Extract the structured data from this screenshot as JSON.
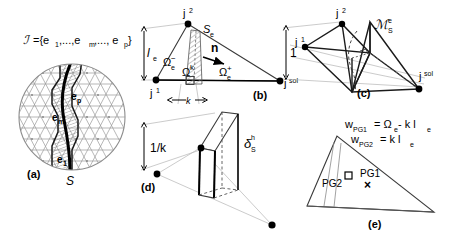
{
  "figure": {
    "caption_type": "multi-panel-scientific-diagram",
    "panels": [
      {
        "id": "a",
        "tag": "(a)",
        "title_formula": "ℐ ={e₁,...,eₘ,..., eₚ}",
        "labels": {
          "set_symbol": "ℐ",
          "set_body": "={e",
          "e_first_sub": "1",
          "mid": ",...,e",
          "e_mid_sub": "m",
          "tail": ",..., e",
          "e_last_sub": "p",
          "close": "}",
          "edge_p": "e",
          "edge_p_sub": "p",
          "edge_m": "e",
          "edge_m_sub": "m",
          "edge_1": "e",
          "edge_1_sub": "1",
          "surface": "S"
        }
      },
      {
        "id": "b",
        "tag": "(b)",
        "labels": {
          "node_j2": "j",
          "node_j2_sup": "2",
          "node_j1": "j",
          "node_j1_sup": "1",
          "node_jsol": "j",
          "node_jsol_sup": "sol",
          "surface_elem": "S",
          "surface_elem_sub": "e",
          "omega_minus": "Ω",
          "omega_minus_sub": "e",
          "omega_minus_sup": "−",
          "omega_plus": "Ω",
          "omega_plus_sub": "e",
          "omega_plus_sup": "+",
          "omega_k": "Ω",
          "omega_k_sup": "k",
          "normal": "n",
          "length_l": "l",
          "length_l_sub": "e",
          "thickness_k": "k"
        }
      },
      {
        "id": "c",
        "tag": "(c)",
        "labels": {
          "node_j2": "j",
          "node_j2_sup": "2",
          "node_j1": "j",
          "node_j1_sup": "1",
          "node_jsol": "j",
          "node_jsol_sup": "sol",
          "manifold": "ℳ",
          "manifold_sub": "S",
          "manifold_sup": "e",
          "height_one": "1"
        }
      },
      {
        "id": "d",
        "tag": "(d)",
        "labels": {
          "height": "1/k",
          "delta": "δ",
          "delta_sub": "S",
          "delta_sup": "h"
        }
      },
      {
        "id": "e",
        "tag": "(e)",
        "labels": {
          "eq1_w": "w",
          "eq1_w_sub": "PG1",
          "eq1_rhs_eq": "= Ω",
          "eq1_rhs_sub": "e",
          "eq1_rhs_tail": "- k l",
          "eq1_rhs_tail_sub": "e",
          "eq2_w": "w",
          "eq2_w_sub": "PG2",
          "eq2_rhs_eq": "=  k l",
          "eq2_rhs_sub": "e",
          "pg1": "PG1",
          "pg2": "PG2",
          "pg1_marker": "×",
          "pg2_marker": "□"
        }
      }
    ],
    "colors": {
      "ink": "#000000",
      "mesh_gray": "#9a9a9a",
      "light_gray": "#b4b4b4",
      "hatch_gray": "#8f8f8f",
      "background": "#ffffff"
    }
  }
}
